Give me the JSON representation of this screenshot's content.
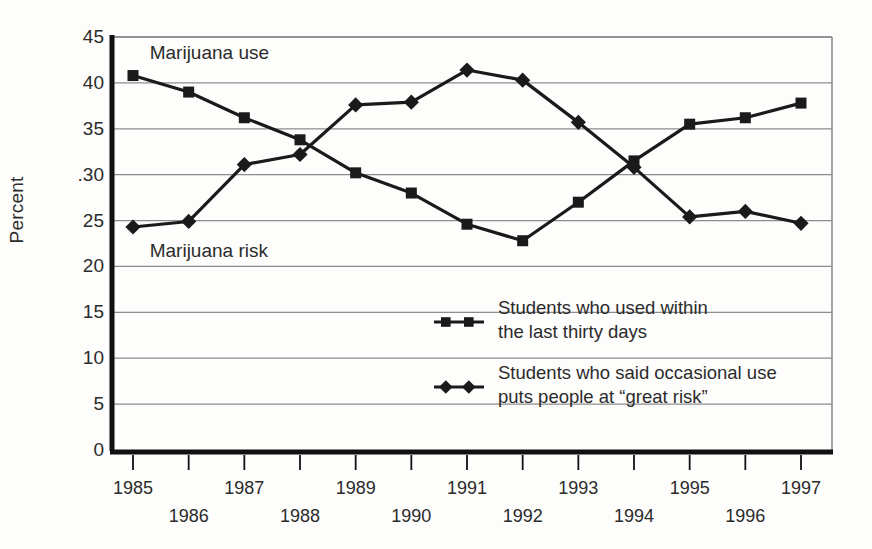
{
  "chart_data": {
    "type": "line",
    "title": "",
    "xlabel": "",
    "ylabel": "Percent",
    "x": [
      1985,
      1986,
      1987,
      1988,
      1989,
      1990,
      1991,
      1992,
      1993,
      1994,
      1995,
      1996,
      1997
    ],
    "xtick_labels": [
      "1985",
      "1986",
      "1987",
      "1988",
      "1989",
      "1990",
      "1991",
      "1992",
      "1993",
      "1994",
      "1995",
      "1996",
      "1997"
    ],
    "ytick_labels": [
      "0",
      "5",
      "10",
      "15",
      "20",
      "25",
      ".30",
      "35",
      "40",
      "45"
    ],
    "ytick_values": [
      0,
      5,
      10,
      15,
      20,
      25,
      30,
      35,
      40,
      45
    ],
    "ylim": [
      0,
      45
    ],
    "grid": "horizontal",
    "legend_position": "inside-center-right",
    "series": [
      {
        "name": "Students who used within the last thirty days",
        "marker": "square",
        "annotation": "Marijuana use",
        "values": [
          40.8,
          39.0,
          36.2,
          33.8,
          30.2,
          28.0,
          24.6,
          22.8,
          27.0,
          31.5,
          35.5,
          36.2,
          37.8
        ]
      },
      {
        "name": "Students who said occasional use puts people at “great risk”",
        "marker": "diamond",
        "annotation": "Marijuana risk",
        "values": [
          24.3,
          24.9,
          31.1,
          32.2,
          37.6,
          37.9,
          41.4,
          40.3,
          35.7,
          30.8,
          25.4,
          26.0,
          24.7
        ]
      }
    ],
    "annotations": [
      {
        "text": "Marijuana use",
        "x": 1985.3,
        "y": 43.2
      },
      {
        "text": "Marijuana risk",
        "x": 1985.3,
        "y": 21.6
      }
    ],
    "legend": [
      {
        "marker": "square",
        "line1": "Students who used within",
        "line2": "the last thirty days"
      },
      {
        "marker": "diamond",
        "line1": "Students who said occasional use",
        "line2": "puts people at “great risk”"
      }
    ],
    "colors": {
      "line": "#1a1a1a",
      "marker": "#1a1a1a",
      "grid": "#8d8d8d",
      "axis": "#111111",
      "background": "#fdfdfc",
      "text": "#2b2b2b"
    }
  }
}
